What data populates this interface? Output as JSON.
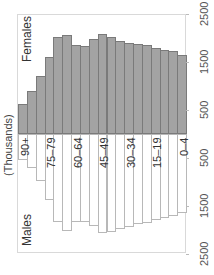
{
  "chart_data": {
    "type": "bar",
    "subtype": "population-pyramid",
    "orientation": "rotated -90deg (age groups along horizontal axis, values vertical: females up, males down)",
    "ylabel": "(Thousands)",
    "series_labels": {
      "female": "Females",
      "male": "Males"
    },
    "categories": [
      "90+",
      "85–89",
      "80–84",
      "75–79",
      "70–74",
      "65–69",
      "60–64",
      "55–59",
      "50–54",
      "45–49",
      "40–44",
      "35–39",
      "30–34",
      "25–29",
      "20–24",
      "15–19",
      "10–14",
      "5–9",
      "0–4"
    ],
    "visible_category_labels": [
      "90+",
      "75–79",
      "60–64",
      "45–49",
      "30–34",
      "15–19",
      "0–4"
    ],
    "series": [
      {
        "name": "Females",
        "color": "#a3a3a3",
        "values": [
          625,
          895,
          1210,
          1605,
          2020,
          2060,
          1855,
          1835,
          1980,
          2085,
          2020,
          1935,
          1895,
          1875,
          1855,
          1790,
          1750,
          1730,
          1645
        ]
      },
      {
        "name": "Males",
        "color": "#ffffff",
        "values": [
          540,
          710,
          980,
          1375,
          1835,
          2020,
          1835,
          1835,
          1915,
          2060,
          2040,
          1980,
          1935,
          1875,
          1855,
          1790,
          1750,
          1710,
          1645
        ]
      }
    ],
    "value_ticks": {
      "female_side": [
        "500",
        "1500",
        "2500"
      ],
      "male_side": [
        "500",
        "1500",
        "2500"
      ]
    },
    "value_range": [
      0,
      2500
    ],
    "grid": false,
    "legend": "none (inline series labels)"
  },
  "labels": {
    "axis_title": "(Thousands)",
    "females": "Females",
    "males": "Males",
    "ticks": [
      "500",
      "1500",
      "2500"
    ]
  }
}
